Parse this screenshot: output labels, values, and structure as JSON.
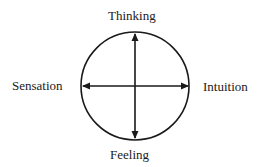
{
  "diagram": {
    "type": "circle-with-crossed-axes",
    "labels": {
      "top": "Thinking",
      "left": "Sensation",
      "right": "Intuition",
      "bottom": "Feeling"
    },
    "axes": [
      {
        "name": "vertical",
        "from": "Thinking",
        "to": "Feeling",
        "arrowheads": "both"
      },
      {
        "name": "horizontal",
        "from": "Sensation",
        "to": "Intuition",
        "arrowheads": "both"
      }
    ],
    "colors": {
      "stroke": "#1a1a1a",
      "background": "#ffffff"
    }
  }
}
